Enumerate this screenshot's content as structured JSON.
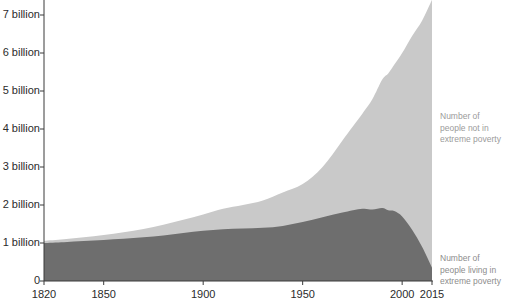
{
  "chart_data": {
    "type": "area",
    "stacked": true,
    "title": "",
    "subtitle": "",
    "xlabel": "",
    "ylabel": "",
    "xlim": [
      1820,
      2015
    ],
    "ylim": [
      0,
      7.4
    ],
    "grid": false,
    "legend_position": "right-inline",
    "y_tick_labels": [
      "7 billion",
      "6 billion",
      "5 billion",
      "4 billion",
      "3 billion",
      "2 billion",
      "1 billion",
      "0"
    ],
    "y_tick_values": [
      7,
      6,
      5,
      4,
      3,
      2,
      1,
      0
    ],
    "x_tick_labels": [
      "1820",
      "1850",
      "1900",
      "1950",
      "2000",
      "2015"
    ],
    "x_tick_values": [
      1820,
      1850,
      1900,
      1950,
      2000,
      2015
    ],
    "x": [
      1820,
      1830,
      1840,
      1850,
      1860,
      1870,
      1880,
      1890,
      1900,
      1910,
      1920,
      1930,
      1940,
      1950,
      1960,
      1970,
      1980,
      1985,
      1990,
      1993,
      1996,
      2000,
      2005,
      2010,
      2015
    ],
    "series": [
      {
        "name": "Number of people living in extreme poverty",
        "color": "#6e6e6e",
        "values": [
          1.0,
          1.02,
          1.05,
          1.08,
          1.11,
          1.15,
          1.2,
          1.26,
          1.32,
          1.36,
          1.38,
          1.4,
          1.45,
          1.55,
          1.68,
          1.8,
          1.9,
          1.88,
          1.92,
          1.86,
          1.84,
          1.7,
          1.35,
          0.9,
          0.35
        ]
      },
      {
        "name": "Number of people not in extreme poverty",
        "color": "#c9c9c9",
        "values": [
          0.06,
          0.08,
          0.1,
          0.13,
          0.17,
          0.22,
          0.28,
          0.35,
          0.43,
          0.54,
          0.62,
          0.72,
          0.88,
          1.0,
          1.32,
          1.9,
          2.5,
          2.9,
          3.38,
          3.6,
          3.85,
          4.3,
          5.1,
          5.95,
          7.05
        ]
      }
    ],
    "annotations": [
      {
        "name": "not-in-poverty-label",
        "lines": [
          "Number of",
          "people not in",
          "extreme poverty"
        ],
        "x_px": 440,
        "y_px": 111,
        "color": "#9b9b9b"
      },
      {
        "name": "in-poverty-label",
        "lines": [
          "Number of",
          "people living in",
          "extreme poverty"
        ],
        "x_px": 440,
        "y_px": 253,
        "color": "#8d8d8d"
      }
    ],
    "axis_color": "#3a3a3a",
    "background": "#ffffff"
  }
}
